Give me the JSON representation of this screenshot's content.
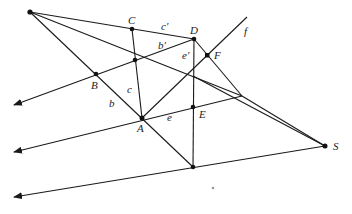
{
  "diagram": {
    "title": "",
    "points": [
      {
        "id": "O",
        "label": ""
      },
      {
        "id": "C",
        "label": "C"
      },
      {
        "id": "D",
        "label": "D"
      },
      {
        "id": "F",
        "label": "F"
      },
      {
        "id": "B",
        "label": "B"
      },
      {
        "id": "A",
        "label": "A"
      },
      {
        "id": "E",
        "label": "E"
      },
      {
        "id": "S",
        "label": "S"
      },
      {
        "id": "P",
        "label": ""
      },
      {
        "id": "G",
        "label": ""
      }
    ],
    "line_labels": {
      "c_prime": "c′",
      "b_prime": "b′",
      "e_prime": "e′",
      "f": "f",
      "b": "b",
      "c": "c",
      "e": "e"
    },
    "colors": {
      "stroke": "#1a1a1a",
      "point": "#111111",
      "background": "#ffffff"
    }
  }
}
